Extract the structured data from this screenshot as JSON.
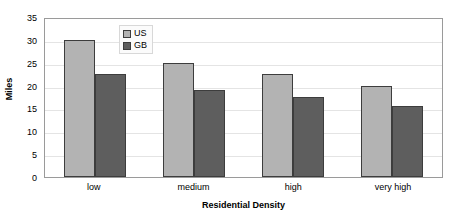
{
  "chart_data": {
    "type": "bar",
    "title": "",
    "categories": [
      "low",
      "medium",
      "high",
      "very high"
    ],
    "series": [
      {
        "name": "US",
        "values": [
          30,
          25,
          22.5,
          20
        ],
        "color": "#b3b3b3"
      },
      {
        "name": "GB",
        "values": [
          22.5,
          19,
          17.5,
          15.5
        ],
        "color": "#5e5e5e"
      }
    ],
    "xlabel": "Residential Density",
    "ylabel": "Miles",
    "ylim": [
      0,
      35
    ],
    "ytick_step": 5,
    "yticks": [
      35,
      30,
      25,
      20,
      15,
      10,
      5,
      0
    ],
    "grid": true,
    "legend_position": "inside-upper-left"
  },
  "axes": {
    "y_title": "Miles",
    "x_title": "Residential Density",
    "y_ticks": [
      "35",
      "30",
      "25",
      "20",
      "15",
      "10",
      "5",
      "0"
    ],
    "x_ticks": [
      "low",
      "medium",
      "high",
      "very high"
    ]
  },
  "legend": {
    "items": [
      {
        "label": "US",
        "swatch": "legend-swatch-us"
      },
      {
        "label": "GB",
        "swatch": "legend-swatch-gb"
      }
    ]
  }
}
